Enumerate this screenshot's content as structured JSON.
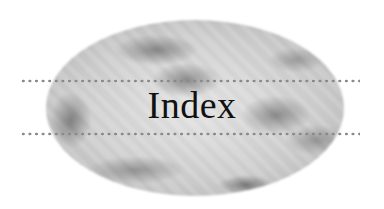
{
  "heading": {
    "title": "Index"
  },
  "colors": {
    "background": "#ffffff",
    "text": "#111111",
    "dots": "#8a8a8a",
    "blob": "#c8c8c8"
  }
}
